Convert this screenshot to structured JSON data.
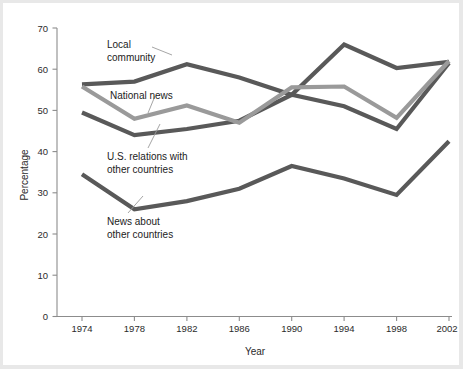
{
  "chart_data": {
    "type": "line",
    "title": "",
    "xlabel": "Year",
    "ylabel": "Percentage",
    "categories": [
      1974,
      1978,
      1982,
      1986,
      1990,
      1994,
      1998,
      2002
    ],
    "tick_labels_x": [
      "1974",
      "1978",
      "1982",
      "1986",
      "1990",
      "1994",
      "1998",
      "2002"
    ],
    "tick_labels_y": [
      "0",
      "10",
      "20",
      "30",
      "40",
      "50",
      "60",
      "70"
    ],
    "ylim": [
      0,
      70
    ],
    "ytick_step": 10,
    "grid": false,
    "legend_position": "inline-annotations",
    "series": [
      {
        "name": "Local community",
        "color": "#595959",
        "values": [
          56.3,
          57.0,
          61.2,
          58.0,
          53.8,
          66.0,
          60.3,
          61.8
        ]
      },
      {
        "name": "National news",
        "color": "#9a9a9a",
        "values": [
          55.8,
          48.0,
          51.2,
          47.0,
          55.6,
          55.8,
          48.2,
          62.0
        ]
      },
      {
        "name": "U.S. relations with other countries",
        "color": "#595959",
        "values": [
          49.5,
          44.0,
          45.5,
          47.5,
          53.8,
          51.0,
          45.5,
          61.5
        ]
      },
      {
        "name": "News about other countries",
        "color": "#595959",
        "values": [
          34.5,
          26.0,
          28.0,
          31.0,
          36.5,
          33.5,
          29.5,
          42.5
        ]
      }
    ],
    "annotations": [
      {
        "text_line1": "Local",
        "text_line2": "community"
      },
      {
        "text_line1": "National news",
        "text_line2": ""
      },
      {
        "text_line1": "U.S. relations with",
        "text_line2": "other countries"
      },
      {
        "text_line1": "News about",
        "text_line2": "other countries"
      }
    ]
  },
  "axes": {
    "y_title": "Percentage",
    "x_title": "Year",
    "y_ticks": [
      "70",
      "60",
      "50",
      "40",
      "30",
      "20",
      "10",
      "0"
    ],
    "x_ticks": [
      "1974",
      "1978",
      "1982",
      "1986",
      "1990",
      "1994",
      "1998",
      "2002"
    ]
  },
  "labels": {
    "local_community_l1": "Local",
    "local_community_l2": "community",
    "national_news": "National news",
    "us_relations_l1": "U.S. relations with",
    "us_relations_l2": "other countries",
    "news_about_l1": "News about",
    "news_about_l2": "other countries"
  },
  "colors": {
    "dark_gray": "#595959",
    "light_gray": "#9a9a9a",
    "axis": "#8c8c8c",
    "text": "#1c1c1c",
    "background": "#ffffff"
  }
}
